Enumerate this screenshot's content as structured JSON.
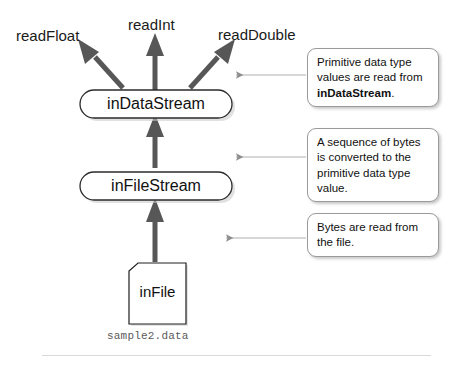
{
  "diagram": {
    "colors": {
      "arrow": "#575757",
      "leader": "#9a9a9a",
      "node_border": "#2b2b2b",
      "shadow": "#bdbdbd",
      "text": "#111111",
      "filename_text": "#5a5a5a",
      "divider": "#d9d9d9",
      "background": "#ffffff"
    },
    "methods": [
      {
        "name": "read-float-label",
        "label": "readFloat"
      },
      {
        "name": "read-int-label",
        "label": "readInt"
      },
      {
        "name": "read-double-label",
        "label": "readDouble"
      }
    ],
    "nodes": [
      {
        "name": "in-data-stream-node",
        "label": "inDataStream",
        "shape": "rounded-rectangle"
      },
      {
        "name": "in-file-stream-node",
        "label": "inFileStream",
        "shape": "rounded-rectangle"
      },
      {
        "name": "in-file-node",
        "label": "inFile",
        "shape": "document"
      }
    ],
    "file": {
      "label": "inFile",
      "filename": "sample2.data"
    },
    "arrows": [
      {
        "name": "arrow-in-data-stream-to-read-float",
        "from": "inDataStream",
        "to": "readFloat",
        "direction": "up-left"
      },
      {
        "name": "arrow-in-data-stream-to-read-int",
        "from": "inDataStream",
        "to": "readInt",
        "direction": "up"
      },
      {
        "name": "arrow-in-data-stream-to-read-double",
        "from": "inDataStream",
        "to": "readDouble",
        "direction": "up-right"
      },
      {
        "name": "arrow-in-file-stream-to-in-data-stream",
        "from": "inFileStream",
        "to": "inDataStream",
        "direction": "up"
      },
      {
        "name": "arrow-in-file-to-in-file-stream",
        "from": "inFile",
        "to": "inFileStream",
        "direction": "up"
      }
    ],
    "callouts": [
      {
        "name": "callout-primitive-values",
        "text_before": "Primitive data type values are read from ",
        "emphasis": "inDataStream",
        "text_after": ".",
        "points_to": "arrow-in-data-stream-to-read-double"
      },
      {
        "name": "callout-byte-conversion",
        "text_before": "A sequence of bytes is converted to the primitive data type value.",
        "emphasis": "",
        "text_after": "",
        "points_to": "arrow-in-file-stream-to-in-data-stream"
      },
      {
        "name": "callout-bytes-from-file",
        "text_before": "Bytes are read from the file.",
        "emphasis": "",
        "text_after": "",
        "points_to": "arrow-in-file-to-in-file-stream"
      }
    ]
  }
}
